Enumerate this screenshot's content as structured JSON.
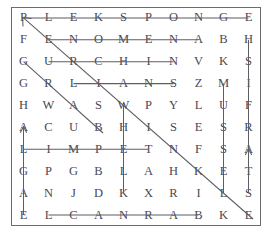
{
  "puzzle": {
    "title": "Word Search Puzzle Grid",
    "rows": 10,
    "cols": 10,
    "grid": [
      [
        "P",
        "L",
        "E",
        "K",
        "S",
        "P",
        "O",
        "N",
        "G",
        "E"
      ],
      [
        "F",
        "E",
        "N",
        "O",
        "M",
        "E",
        "N",
        "A",
        "B",
        "H"
      ],
      [
        "G",
        "U",
        "R",
        "C",
        "H",
        "I",
        "N",
        "V",
        "K",
        "S"
      ],
      [
        "G",
        "R",
        "L",
        "I",
        "A",
        "N",
        "S",
        "Z",
        "M",
        "I"
      ],
      [
        "H",
        "W",
        "A",
        "S",
        "W",
        "P",
        "Y",
        "L",
        "U",
        "F"
      ],
      [
        "A",
        "C",
        "U",
        "B",
        "H",
        "I",
        "S",
        "E",
        "S",
        "R"
      ],
      [
        "L",
        "I",
        "M",
        "P",
        "E",
        "T",
        "N",
        "F",
        "S",
        "A"
      ],
      [
        "G",
        "P",
        "G",
        "B",
        "L",
        "A",
        "H",
        "K",
        "E",
        "T"
      ],
      [
        "A",
        "N",
        "J",
        "D",
        "K",
        "X",
        "R",
        "I",
        "L",
        "S"
      ],
      [
        "E",
        "L",
        "C",
        "A",
        "N",
        "R",
        "A",
        "B",
        "K",
        "E"
      ]
    ],
    "border_color": "#6b6b70",
    "letter_color": "#4a4a52",
    "mark_color": "#5d5d63",
    "found_words": [
      {
        "word": "PLEKSPONGE",
        "orientation": "horizontal",
        "row": 0,
        "col_start": 0,
        "col_end": 9
      },
      {
        "word": "FENOMENA",
        "orientation": "horizontal",
        "row": 1,
        "col_start": 1,
        "col_end": 7
      },
      {
        "word": "URCHIN",
        "orientation": "horizontal",
        "row": 2,
        "col_start": 1,
        "col_end": 6
      },
      {
        "word": "LIANS",
        "orientation": "horizontal",
        "row": 3,
        "col_start": 2,
        "col_end": 6
      },
      {
        "word": "LIMPET",
        "orientation": "horizontal",
        "row": 6,
        "col_start": 0,
        "col_end": 5
      },
      {
        "word": "LCANRAB",
        "orientation": "horizontal",
        "row": 9,
        "col_start": 1,
        "col_end": 7
      },
      {
        "word": "ALGAE",
        "orientation": "vertical-up",
        "col": 0,
        "row_start": 9,
        "row_end": 5
      },
      {
        "word": "WHELK",
        "orientation": "vertical-down",
        "col": 4,
        "row_start": 4,
        "row_end": 8
      },
      {
        "word": "MUSSEL",
        "orientation": "vertical-down",
        "col": 8,
        "row_start": 3,
        "row_end": 8
      },
      {
        "word": "STARFISH",
        "orientation": "vertical-up",
        "col": 9,
        "row_start": 8,
        "row_end": 1
      },
      {
        "word": "DIAGONAL-LONG",
        "orientation": "diagonal-down-right",
        "row_start": 0,
        "col_start": 0,
        "row_end": 9,
        "col_end": 9
      },
      {
        "word": "DIAGONAL-SHORT",
        "orientation": "diagonal-down-right",
        "row_start": 2,
        "col_start": 0,
        "row_end": 5,
        "col_end": 3
      }
    ]
  }
}
